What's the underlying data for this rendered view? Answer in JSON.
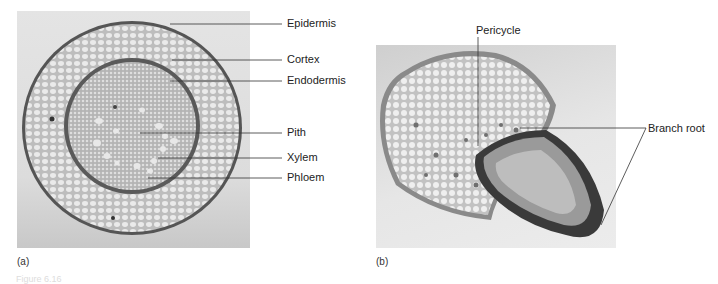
{
  "figure": {
    "caption_fragment": "Figure 6.16",
    "panels": [
      {
        "id": "a",
        "letter": "(a)",
        "description": "Cross section of a root",
        "labels": [
          "Epidermis",
          "Cortex",
          "Endodermis",
          "Pith",
          "Xylem",
          "Phloem"
        ]
      },
      {
        "id": "b",
        "letter": "(b)",
        "description": "Cross section showing branch root emerging from pericycle",
        "labels": [
          "Pericycle",
          "Branch root"
        ]
      }
    ]
  }
}
